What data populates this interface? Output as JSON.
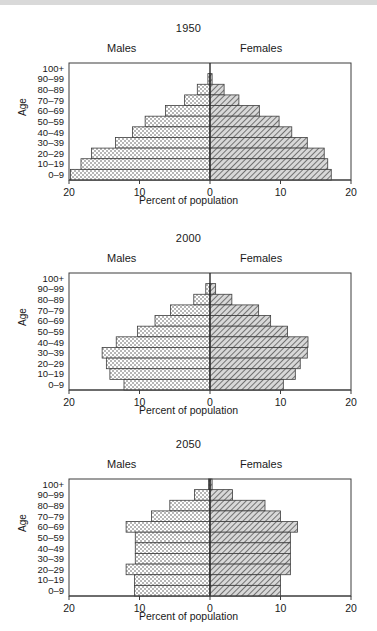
{
  "figure": {
    "axis_y_title": "Age",
    "axis_x_title": "Percent of population",
    "male_label": "Males",
    "female_label": "Females",
    "age_groups": [
      "100+",
      "90–99",
      "80–89",
      "70–79",
      "60–69",
      "50–59",
      "40–49",
      "30–39",
      "20–29",
      "10–19",
      "0–9"
    ],
    "x_ticks": [
      "20",
      "10",
      "0",
      "10",
      "20"
    ],
    "x_tick_values": [
      -20,
      -10,
      0,
      10,
      20
    ],
    "xlim": [
      -20,
      20
    ],
    "colors": {
      "frame": "#3d3d3d",
      "male_fill": "#ffffff",
      "male_pattern": "#4a4a4a",
      "female_fill": "#d8d8d8",
      "female_pattern": "#585858",
      "text": "#1a1a1a",
      "top_rule": "#d9d9d9"
    }
  },
  "chart_data": [
    {
      "type": "bar",
      "title": "1950",
      "xlabel": "Percent of population",
      "ylabel": "Age",
      "xlim": [
        -20,
        20
      ],
      "grid": false,
      "legend": [
        "Males",
        "Females"
      ],
      "categories": [
        "100+",
        "90–99",
        "80–89",
        "70–79",
        "60–69",
        "50–59",
        "40–49",
        "30–39",
        "20–29",
        "10–19",
        "0–9"
      ],
      "series": [
        {
          "name": "Males",
          "values": [
            0.0,
            0.3,
            1.8,
            3.6,
            6.3,
            9.2,
            11.0,
            13.4,
            16.8,
            18.3,
            19.8
          ]
        },
        {
          "name": "Females",
          "values": [
            0.0,
            0.3,
            2.0,
            4.1,
            7.0,
            9.8,
            11.6,
            13.8,
            16.2,
            16.7,
            17.2
          ]
        }
      ]
    },
    {
      "type": "bar",
      "title": "2000",
      "xlabel": "Percent of population",
      "ylabel": "Age",
      "xlim": [
        -20,
        20
      ],
      "grid": false,
      "legend": [
        "Males",
        "Females"
      ],
      "categories": [
        "100+",
        "90–99",
        "80–89",
        "70–79",
        "60–69",
        "50–59",
        "40–49",
        "30–39",
        "20–29",
        "10–19",
        "0–9"
      ],
      "series": [
        {
          "name": "Males",
          "values": [
            0.0,
            0.6,
            2.3,
            5.6,
            7.8,
            10.3,
            13.3,
            15.3,
            14.7,
            14.2,
            12.2
          ]
        },
        {
          "name": "Females",
          "values": [
            0.0,
            0.8,
            3.1,
            6.9,
            8.6,
            11.0,
            13.9,
            13.8,
            12.8,
            12.1,
            10.4
          ]
        }
      ]
    },
    {
      "type": "bar",
      "title": "2050",
      "xlabel": "Percent of population",
      "ylabel": "Age",
      "xlim": [
        -20,
        20
      ],
      "grid": false,
      "legend": [
        "Males",
        "Females"
      ],
      "categories": [
        "100+",
        "90–99",
        "80–89",
        "70–79",
        "60–69",
        "50–59",
        "40–49",
        "30–39",
        "20–29",
        "10–19",
        "0–9"
      ],
      "series": [
        {
          "name": "Males",
          "values": [
            0.2,
            2.2,
            5.7,
            8.3,
            11.9,
            10.6,
            10.6,
            10.6,
            11.9,
            10.7,
            10.7
          ]
        },
        {
          "name": "Females",
          "values": [
            0.3,
            3.2,
            7.8,
            10.0,
            12.4,
            11.4,
            11.4,
            11.4,
            11.4,
            10.0,
            10.0
          ]
        }
      ]
    }
  ]
}
